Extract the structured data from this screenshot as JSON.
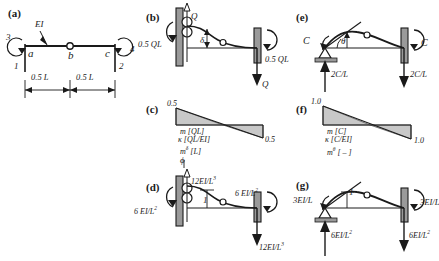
{
  "figure": {
    "type": "structural-engineering-beam-diagram",
    "stroke_color": "#1a1a1a",
    "fill_gray": "#c8c8c8",
    "support_gray": "#9a9a9a"
  },
  "panels": {
    "a": {
      "tag": "(a)",
      "node_a": "a",
      "node_b": "b",
      "node_c": "c",
      "flexural_rigidity": "EI",
      "dof_3": "3",
      "dof_1": "1",
      "dof_4": "4",
      "dof_2": "2",
      "dim_left": "0.5 L",
      "dim_right": "0.5 L"
    },
    "b": {
      "tag": "(b)",
      "load": "Q",
      "moment_left": "0.5 QL",
      "moment_right": "0.5 QL",
      "reaction_right": "Q",
      "deflection": "δ"
    },
    "c": {
      "tag": "(c)",
      "peak_left": "0.5",
      "peak_right": "0.5",
      "line1": "m [QL]",
      "line2": "κ [QL/EI]",
      "line3": "m",
      "line3_sup": "δ",
      "line3_unit": " [L]",
      "line4": "ϕ"
    },
    "d": {
      "tag": "(d)",
      "force_top": "12EI/L",
      "force_top_sup": "3",
      "moment_left": "6 EI/L",
      "moment_left_sup": "2",
      "moment_right": "6 EI/L",
      "moment_right_sup": "2",
      "force_bottom": "12EI/L",
      "force_bottom_sup": "3",
      "unit_disp": "1"
    },
    "e": {
      "tag": "(e)",
      "moment_left": "C",
      "moment_right": "C",
      "reaction_left": "2C/L",
      "reaction_right": "2C/L",
      "angle": "θ"
    },
    "f": {
      "tag": "(f)",
      "peak_left": "1.0",
      "peak_right": "1.0",
      "line1": "m [C]",
      "line2": "κ [C/EI]",
      "line3": "m",
      "line3_sup": "θ",
      "line3_unit": " [ – ]"
    },
    "g": {
      "tag": "(g)",
      "moment_left": "3EI/L",
      "moment_right": "3EI/L",
      "reaction_left": "6EI/L",
      "reaction_left_sup": "2",
      "reaction_right": "6EI/L",
      "reaction_right_sup": "2",
      "unit_rot": "1"
    }
  }
}
